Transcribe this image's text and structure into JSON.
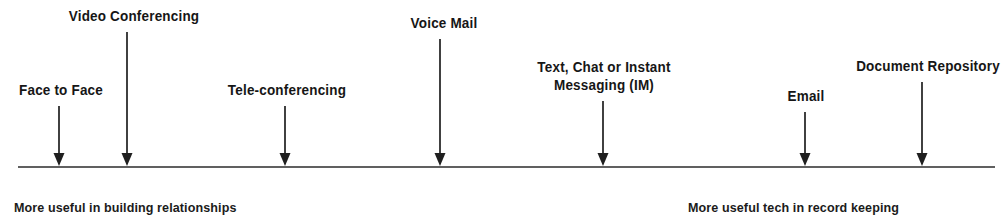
{
  "figure": {
    "type": "continuum-diagram",
    "title": "",
    "axis": {
      "name": "communication-technology-continuum",
      "x_start": 18,
      "x_end": 995,
      "y": 167,
      "stroke": "#2b2b2b",
      "stroke_width": 1.6
    },
    "arrow_color": "#1f1f1f",
    "items": [
      {
        "id": "face-to-face",
        "label": "Face to Face",
        "lines": [
          "Face to Face"
        ],
        "arrow_x": 59,
        "label_center_x": 61,
        "label_top_y": 82,
        "stem_top_y": 106
      },
      {
        "id": "video-conferencing",
        "label": "Video Conferencing",
        "lines": [
          "Video Conferencing"
        ],
        "arrow_x": 127,
        "label_center_x": 134,
        "label_top_y": 8,
        "stem_top_y": 32
      },
      {
        "id": "tele-conferencing",
        "label": "Tele-conferencing",
        "lines": [
          "Tele-conferencing"
        ],
        "arrow_x": 285,
        "label_center_x": 287,
        "label_top_y": 82,
        "stem_top_y": 106
      },
      {
        "id": "voice-mail",
        "label": "Voice Mail",
        "lines": [
          "Voice Mail"
        ],
        "arrow_x": 440,
        "label_center_x": 444,
        "label_top_y": 15,
        "stem_top_y": 39
      },
      {
        "id": "text-chat-im",
        "label": "Text, Chat or Instant Messaging (IM)",
        "lines": [
          "Text, Chat or Instant",
          "Messaging (IM)"
        ],
        "arrow_x": 603,
        "label_center_x": 604,
        "label_top_y": 58,
        "stem_top_y": 101
      },
      {
        "id": "email",
        "label": "Email",
        "lines": [
          "Email"
        ],
        "arrow_x": 805,
        "label_center_x": 806,
        "label_top_y": 88,
        "stem_top_y": 112
      },
      {
        "id": "document-repository",
        "label": "Document Repository",
        "lines": [
          "Document Repository"
        ],
        "arrow_x": 922,
        "label_center_x": 928,
        "label_top_y": 58,
        "stem_top_y": 82
      }
    ],
    "captions": [
      {
        "id": "left-caption",
        "text": "More useful in building relationships",
        "x": 14,
        "y": 200
      },
      {
        "id": "right-caption",
        "text": "More useful tech in record keeping",
        "x": 688,
        "y": 200
      }
    ]
  },
  "chart_data": {
    "type": "table",
    "xlabel": "",
    "ylabel": "",
    "categories": [
      "Face to Face",
      "Video Conferencing",
      "Tele-conferencing",
      "Voice Mail",
      "Text, Chat or Instant Messaging (IM)",
      "Email",
      "Document Repository"
    ],
    "values": [
      59,
      127,
      285,
      440,
      603,
      805,
      922
    ],
    "annotations": [
      "More useful in building relationships",
      "More useful tech in record keeping"
    ],
    "axis_range": [
      18,
      995
    ],
    "grid": false,
    "legend": "none"
  }
}
